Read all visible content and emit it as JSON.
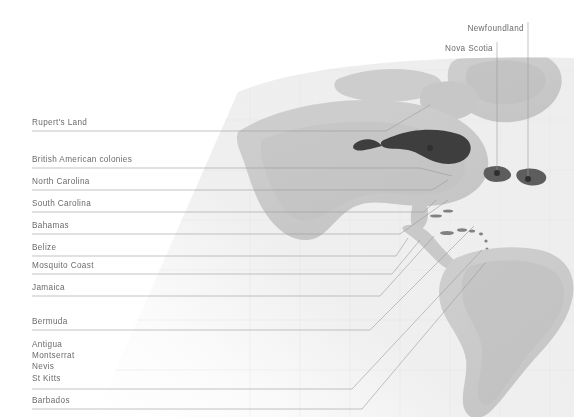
{
  "figure": {
    "kind": "annotated-relief-map",
    "width": 574,
    "height": 417,
    "background_color": "#ffffff",
    "ocean_color": "#eeeeee",
    "land_color": "#d2d2d2",
    "highlight_color": "#3a3a3a",
    "label_color": "#6b6b6b",
    "leader_line_color": "#9a9a9a"
  },
  "left_labels": [
    {
      "id": "ruperts-land",
      "text": "Rupert's Land",
      "x": 32,
      "y": 118,
      "rule_y": 131
    },
    {
      "id": "british-american-colonies",
      "text": "British American colonies",
      "x": 32,
      "y": 155,
      "rule_y": 168
    },
    {
      "id": "north-carolina",
      "text": "North Carolina",
      "x": 32,
      "y": 177,
      "rule_y": 190
    },
    {
      "id": "south-carolina",
      "text": "South Carolina",
      "x": 32,
      "y": 199,
      "rule_y": 212
    },
    {
      "id": "bahamas",
      "text": "Bahamas",
      "x": 32,
      "y": 221,
      "rule_y": 234
    },
    {
      "id": "belize",
      "text": "Belize",
      "x": 32,
      "y": 243,
      "rule_y": 256
    },
    {
      "id": "mosquito-coast",
      "text": "Mosquito Coast",
      "x": 32,
      "y": 261,
      "rule_y": 274
    },
    {
      "id": "jamaica",
      "text": "Jamaica",
      "x": 32,
      "y": 283,
      "rule_y": 296
    },
    {
      "id": "bermuda",
      "text": "Bermuda",
      "x": 32,
      "y": 317,
      "rule_y": 330
    }
  ],
  "left_label_group": {
    "id": "leeward-islands",
    "x": 32,
    "y": 339,
    "rule_y": 389,
    "items": [
      "Antigua",
      "Montserrat",
      "Nevis",
      "St Kitts"
    ]
  },
  "left_label_last": {
    "id": "barbados",
    "text": "Barbados",
    "x": 32,
    "y": 396,
    "rule_y": 409
  },
  "top_labels": [
    {
      "id": "newfoundland",
      "text": "Newfoundland",
      "x_right": 527,
      "y": 24,
      "line_x": 528,
      "line_y1": 22,
      "line_y2": 178
    },
    {
      "id": "nova-scotia",
      "text": "Nova Scotia",
      "x_right": 496,
      "y": 44,
      "line_x": 497,
      "line_y1": 42,
      "line_y2": 172
    }
  ],
  "leader_paths": [
    {
      "id": "path-ruperts-land",
      "d": "M32 131 H386 L430 105"
    },
    {
      "id": "path-british-american-colonies",
      "d": "M32 168 H420 L452 176"
    },
    {
      "id": "path-north-carolina",
      "d": "M32 190 H432 L448 180"
    },
    {
      "id": "path-south-carolina",
      "d": "M32 212 H424 L436 200"
    },
    {
      "id": "path-bahamas",
      "d": "M32 234 H400 L448 200"
    },
    {
      "id": "path-belize",
      "d": "M32 256 H396 L408 238"
    },
    {
      "id": "path-mosquito-coast",
      "d": "M32 274 H392 L420 240"
    },
    {
      "id": "path-jamaica",
      "d": "M32 296 H380 L434 236"
    },
    {
      "id": "path-bermuda",
      "d": "M32 330 H370 L474 226"
    },
    {
      "id": "path-leeward-islands",
      "d": "M32 389 H352 L482 250"
    },
    {
      "id": "path-barbados",
      "d": "M32 409 H362 L486 262"
    }
  ],
  "map_markers": [
    {
      "id": "marker-hudson-bay",
      "cx": 430,
      "cy": 148,
      "r": 3
    },
    {
      "id": "marker-nova-scotia",
      "cx": 497,
      "cy": 173,
      "r": 3
    },
    {
      "id": "marker-newfoundland",
      "cx": 528,
      "cy": 179,
      "r": 3
    }
  ]
}
